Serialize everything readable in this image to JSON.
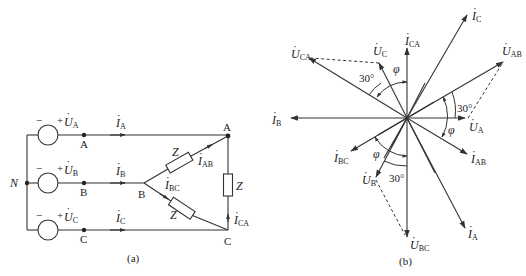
{
  "figure_a": {
    "caption": "(a)",
    "neutral_label": "N",
    "sources": [
      {
        "phase": "A",
        "voltage_main": "U",
        "voltage_sub": "A",
        "minus": "−",
        "plus": "+",
        "node": "A",
        "current_main": "I",
        "current_sub": "A"
      },
      {
        "phase": "B",
        "voltage_main": "U",
        "voltage_sub": "B",
        "minus": "−",
        "plus": "+",
        "node": "B",
        "current_main": "I",
        "current_sub": "B"
      },
      {
        "phase": "C",
        "voltage_main": "U",
        "voltage_sub": "C",
        "minus": "−",
        "plus": "+",
        "node": "C",
        "current_main": "I",
        "current_sub": "C"
      }
    ],
    "load": {
      "node_A": "A",
      "node_B": "B",
      "node_C": "C",
      "impedance_label": "Z",
      "currents": [
        {
          "main": "I",
          "sub": "AB"
        },
        {
          "main": "I",
          "sub": "BC"
        },
        {
          "main": "I",
          "sub": "CA"
        }
      ]
    }
  },
  "figure_b": {
    "caption": "(b)",
    "phasors": [
      {
        "main": "I",
        "sub": "C"
      },
      {
        "main": "I",
        "sub": "CA"
      },
      {
        "main": "U",
        "sub": "C"
      },
      {
        "main": "U",
        "sub": "CA"
      },
      {
        "main": "U",
        "sub": "AB"
      },
      {
        "main": "U",
        "sub": "A"
      },
      {
        "main": "I",
        "sub": "AB"
      },
      {
        "main": "I",
        "sub": "A"
      },
      {
        "main": "U",
        "sub": "BC"
      },
      {
        "main": "U",
        "sub": "B"
      },
      {
        "main": "I",
        "sub": "BC"
      },
      {
        "main": "I",
        "sub": "B"
      }
    ],
    "angles": {
      "thirty": "30°",
      "phi": "φ"
    }
  }
}
